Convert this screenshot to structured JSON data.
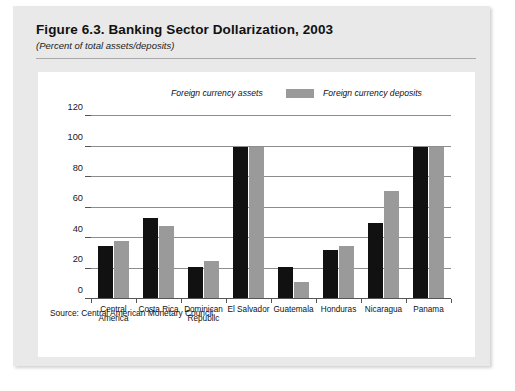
{
  "figure": {
    "title": "Figure 6.3.  Banking Sector Dollarization, 2003",
    "subtitle": "(Percent of total assets/deposits)",
    "source": "Source: Central American Monetary Council."
  },
  "colors": {
    "assets": "#111111",
    "deposits": "#9a9a9a",
    "page_background": "#e9e9e9",
    "panel_background": "#ffffff",
    "gridline": "#8d8d8d"
  },
  "chart_data": {
    "type": "bar",
    "title": "Figure 6.3.  Banking Sector Dollarization, 2003",
    "subtitle": "(Percent of total assets/deposits)",
    "xlabel": "",
    "ylabel": "",
    "ylim": [
      0,
      120
    ],
    "yticks": [
      0,
      20,
      40,
      60,
      80,
      100,
      120
    ],
    "ytick_labels": [
      "0",
      "20",
      "40",
      "60",
      "80",
      "100",
      "120"
    ],
    "grid": true,
    "legend_position": "top",
    "categories": [
      "Central\nAmerica",
      "Costa Rica",
      "Dominican\nRepublic",
      "El Salvador",
      "Guatemala",
      "Honduras",
      "Nicaragua",
      "Panama"
    ],
    "series": [
      {
        "name": "Foreign currency assets",
        "color": "#111111",
        "values": [
          35,
          53,
          21,
          100,
          21,
          32,
          50,
          100
        ]
      },
      {
        "name": "Foreign currency deposits",
        "color": "#9a9a9a",
        "values": [
          38,
          48,
          25,
          100,
          11,
          35,
          71,
          100
        ]
      }
    ]
  }
}
